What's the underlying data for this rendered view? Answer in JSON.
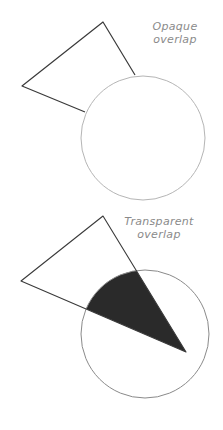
{
  "figure": {
    "panels": [
      {
        "id": "opaque",
        "label_line1": "Opaque",
        "label_line2": "overlap",
        "triangle": {
          "points": [
            [
              22,
              86
            ],
            [
              103,
              22
            ],
            [
              135,
              75
            ],
            [
              85,
              112
            ]
          ]
        },
        "circle": {
          "cx": 143,
          "cy": 138,
          "r": 62
        },
        "overlap_fill": "none"
      },
      {
        "id": "transparent",
        "label_line1": "Transparent",
        "label_line2": "overlap",
        "triangle": {
          "points": [
            [
              21,
              66
            ],
            [
              103,
              1
            ],
            [
              186,
              137
            ]
          ]
        },
        "circle": {
          "cx": 145,
          "cy": 119,
          "r": 64
        },
        "overlap_fill": "#2a2a2a"
      }
    ],
    "colors": {
      "stroke_dark": "#3a3a3a",
      "stroke_light": "#b5b5b5",
      "overlap": "#2a2a2a",
      "label": "#8a8a8a"
    }
  }
}
